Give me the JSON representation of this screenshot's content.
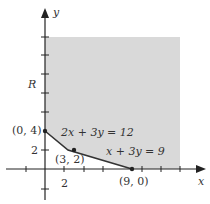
{
  "diagram": {
    "type": "feasible-region",
    "region_label": "R",
    "axes": {
      "x_label": "x",
      "y_label": "y",
      "x_tick_label": "2",
      "y_tick_label": "2"
    },
    "vertices": [
      {
        "label": "(0, 4)",
        "x": 0,
        "y": 4
      },
      {
        "label": "(3, 2)",
        "x": 3,
        "y": 2
      },
      {
        "label": "(9, 0)",
        "x": 9,
        "y": 0
      }
    ],
    "lines": [
      {
        "label": "2x + 3y = 12"
      },
      {
        "label": "x + 3y = 9"
      }
    ],
    "colors": {
      "region": "#d9d9d9",
      "axis": "#222222",
      "boundary": "#333333",
      "text": "#333333"
    }
  }
}
